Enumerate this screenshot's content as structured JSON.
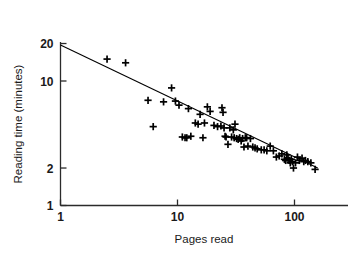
{
  "chart_data": {
    "type": "scatter",
    "title": "",
    "xlabel": "Pages read",
    "ylabel": "Reading time (minutes)",
    "xscale": "log",
    "yscale": "log",
    "xlim": [
      1,
      180
    ],
    "ylim": [
      1,
      30
    ],
    "xticks": [
      1,
      10,
      100
    ],
    "xtick_labels": [
      "1",
      "10",
      "100"
    ],
    "yticks": [
      1,
      2,
      10,
      20
    ],
    "ytick_labels": [
      "1",
      "2",
      "10",
      "20"
    ],
    "grid": false,
    "legend": "none",
    "marker": "plus",
    "marker_color": "#000000",
    "line_color": "#000000",
    "axis_color": "#222222",
    "background": "#ffffff",
    "series": [
      {
        "name": "Reading sessions",
        "marker": "plus",
        "points": [
          [
            2.5,
            15.0
          ],
          [
            3.6,
            14.0
          ],
          [
            5.6,
            7.0
          ],
          [
            6.2,
            4.3
          ],
          [
            7.6,
            6.8
          ],
          [
            8.9,
            8.8
          ],
          [
            9.6,
            6.9
          ],
          [
            10.3,
            6.4
          ],
          [
            11.0,
            3.55
          ],
          [
            11.6,
            3.5
          ],
          [
            12.0,
            3.5
          ],
          [
            12.4,
            6.0
          ],
          [
            13.0,
            3.6
          ],
          [
            14.2,
            4.6
          ],
          [
            15.0,
            4.5
          ],
          [
            15.6,
            5.4
          ],
          [
            16.5,
            3.5
          ],
          [
            17.0,
            4.6
          ],
          [
            18.0,
            6.2
          ],
          [
            19.0,
            5.7
          ],
          [
            20.5,
            4.4
          ],
          [
            22.0,
            4.3
          ],
          [
            23.5,
            4.35
          ],
          [
            24.0,
            6.1
          ],
          [
            24.5,
            5.6
          ],
          [
            25.0,
            4.2
          ],
          [
            25.5,
            3.6
          ],
          [
            26.0,
            3.55
          ],
          [
            27.0,
            3.1
          ],
          [
            28.0,
            4.2
          ],
          [
            29.0,
            3.55
          ],
          [
            30.0,
            4.05
          ],
          [
            30.5,
            3.5
          ],
          [
            31.0,
            4.5
          ],
          [
            32.0,
            3.45
          ],
          [
            33.0,
            3.4
          ],
          [
            34.0,
            3.5
          ],
          [
            35.0,
            3.3
          ],
          [
            36.0,
            3.45
          ],
          [
            37.0,
            2.95
          ],
          [
            38.0,
            3.5
          ],
          [
            39.0,
            3.5
          ],
          [
            40.0,
            3.0
          ],
          [
            42.0,
            3.45
          ],
          [
            44.0,
            2.95
          ],
          [
            46.0,
            2.9
          ],
          [
            48.0,
            2.85
          ],
          [
            52.0,
            2.8
          ],
          [
            55.0,
            2.8
          ],
          [
            58.0,
            2.75
          ],
          [
            62.0,
            3.0
          ],
          [
            66.0,
            2.75
          ],
          [
            70.0,
            2.45
          ],
          [
            74.0,
            2.5
          ],
          [
            78.0,
            2.6
          ],
          [
            82.0,
            2.35
          ],
          [
            84.0,
            2.3
          ],
          [
            86.0,
            2.55
          ],
          [
            88.0,
            2.4
          ],
          [
            90.0,
            2.3
          ],
          [
            92.0,
            2.2
          ],
          [
            94.0,
            2.35
          ],
          [
            96.0,
            2.25
          ],
          [
            98.0,
            2.0
          ],
          [
            102.0,
            2.2
          ],
          [
            106.0,
            2.45
          ],
          [
            110.0,
            2.3
          ],
          [
            116.0,
            2.4
          ],
          [
            120.0,
            2.25
          ],
          [
            124.0,
            2.3
          ],
          [
            130.0,
            2.25
          ],
          [
            138.0,
            2.2
          ],
          [
            150.0,
            1.95
          ]
        ]
      }
    ],
    "fit_line": {
      "name": "fitted power-law line",
      "x_start": 1.0,
      "y_start": 19.5,
      "x_end": 158.0,
      "y_end": 2.0
    }
  }
}
